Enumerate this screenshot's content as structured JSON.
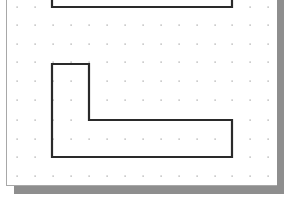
{
  "canvas": {
    "background": "#ffffff",
    "page_shadow_color": "#8e8e8e",
    "page_border_color": "#a8a8a8",
    "grid": {
      "type": "dot-grid",
      "dot_color": "#9a9a9a",
      "x_positions": [
        17,
        35,
        53,
        71,
        89,
        107,
        125,
        143,
        161,
        179,
        197,
        215,
        232,
        250,
        268
      ],
      "y_positions": [
        7,
        25,
        44,
        62,
        81,
        100,
        120,
        139,
        157,
        176
      ]
    },
    "shapes": [
      {
        "name": "top-rectangle",
        "kind": "polyline",
        "stroke": "#2a2a2a",
        "points": "52,-10 52,7 232,7 232,-10"
      },
      {
        "name": "l-shape",
        "kind": "polygon",
        "stroke": "#2a2a2a",
        "points": "52,64 89,64 89,120 232,120 232,157 52,157"
      }
    ]
  }
}
